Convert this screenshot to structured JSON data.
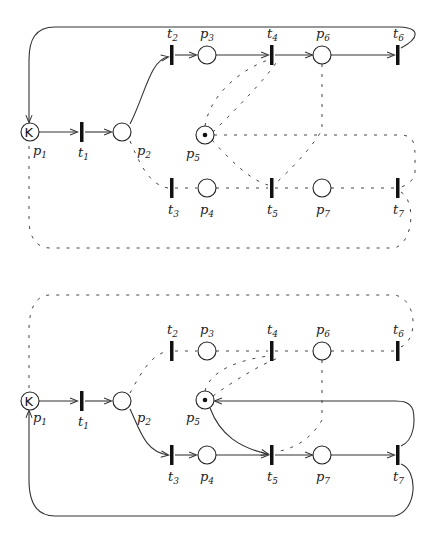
{
  "figure": {
    "nets": [
      {
        "id": "top",
        "places": [
          {
            "name": "p",
            "sub": "1",
            "token": "K"
          },
          {
            "name": "p",
            "sub": "2"
          },
          {
            "name": "p",
            "sub": "3"
          },
          {
            "name": "p",
            "sub": "4"
          },
          {
            "name": "p",
            "sub": "5",
            "token": "•"
          },
          {
            "name": "p",
            "sub": "6"
          },
          {
            "name": "p",
            "sub": "7"
          }
        ],
        "transitions": [
          {
            "name": "t",
            "sub": "1"
          },
          {
            "name": "t",
            "sub": "2"
          },
          {
            "name": "t",
            "sub": "3"
          },
          {
            "name": "t",
            "sub": "4"
          },
          {
            "name": "t",
            "sub": "5"
          },
          {
            "name": "t",
            "sub": "6"
          },
          {
            "name": "t",
            "sub": "7"
          }
        ],
        "active_path": "p1→t1→p2→t2→p3→t4→p6→t6→p1",
        "dashed_path": "p2→t3→p4→t5→p7→t7→p1"
      },
      {
        "id": "bottom",
        "places": [
          {
            "name": "p",
            "sub": "1",
            "token": "K"
          },
          {
            "name": "p",
            "sub": "2"
          },
          {
            "name": "p",
            "sub": "3"
          },
          {
            "name": "p",
            "sub": "4"
          },
          {
            "name": "p",
            "sub": "5",
            "token": "•"
          },
          {
            "name": "p",
            "sub": "6"
          },
          {
            "name": "p",
            "sub": "7"
          }
        ],
        "transitions": [
          {
            "name": "t",
            "sub": "1"
          },
          {
            "name": "t",
            "sub": "2"
          },
          {
            "name": "t",
            "sub": "3"
          },
          {
            "name": "t",
            "sub": "4"
          },
          {
            "name": "t",
            "sub": "5"
          },
          {
            "name": "t",
            "sub": "6"
          },
          {
            "name": "t",
            "sub": "7"
          }
        ],
        "active_path": "p1→t1→p2→t3→p4→t5→p7→t7→p1, p5→t5, t7→p5",
        "dashed_path": "p2→t2→p3→t4→p6→t6→p1"
      }
    ],
    "labels": {
      "k": "K",
      "p": "p",
      "t": "t",
      "s1": "1",
      "s2": "2",
      "s3": "3",
      "s4": "4",
      "s5": "5",
      "s6": "6",
      "s7": "7"
    }
  }
}
